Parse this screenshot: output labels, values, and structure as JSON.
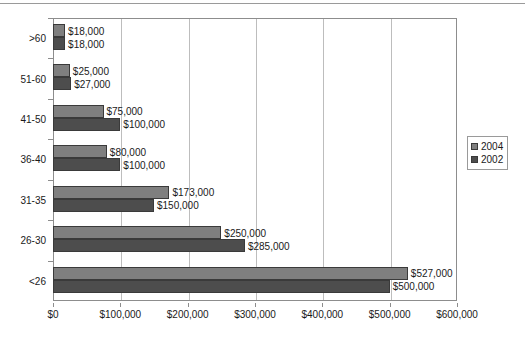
{
  "chart_data": {
    "type": "bar",
    "orientation": "horizontal",
    "title": "",
    "subtitle": "",
    "xlabel": "",
    "ylabel": "",
    "xlim": [
      0,
      600000
    ],
    "xticks": [
      0,
      100000,
      200000,
      300000,
      400000,
      500000,
      600000
    ],
    "xtick_labels": [
      "$0",
      "$100,000",
      "$200,000",
      "$300,000",
      "$400,000",
      "$500,000",
      "$600,000"
    ],
    "grid": true,
    "grid_axis": "x",
    "legend_position": "right",
    "categories": [
      "<26",
      "26-30",
      "31-35",
      "36-40",
      "41-50",
      "51-60",
      ">60"
    ],
    "categories_top_to_bottom": [
      ">60",
      "51-60",
      "41-50",
      "36-40",
      "31-35",
      "26-30",
      "<26"
    ],
    "series": [
      {
        "name": "2004",
        "color": "#7f7f7f",
        "values": [
          527000,
          250000,
          173000,
          80000,
          75000,
          25000,
          18000
        ],
        "data_labels": [
          "$527,000",
          "$250,000",
          "$173,000",
          "$80,000",
          "$75,000",
          "$25,000",
          "$18,000"
        ]
      },
      {
        "name": "2002",
        "color": "#4d4d4d",
        "values": [
          500000,
          285000,
          150000,
          100000,
          100000,
          27000,
          18000
        ],
        "data_labels": [
          "$500,000",
          "$285,000",
          "$150,000",
          "$100,000",
          "$100,000",
          "$27,000",
          "$18,000"
        ]
      }
    ]
  },
  "legend": {
    "items": [
      {
        "label": "2004",
        "color": "#7f7f7f"
      },
      {
        "label": "2002",
        "color": "#4d4d4d"
      }
    ]
  },
  "colors": {
    "series_2004": "#7f7f7f",
    "series_2002": "#4d4d4d",
    "axis": "#8d8d8d",
    "gridline": "#bdbdbd",
    "text": "#1a1a1a",
    "background": "#ffffff"
  }
}
